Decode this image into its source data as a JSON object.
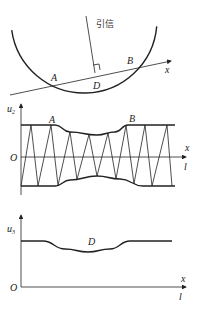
{
  "top_panel": {
    "fuze_label": "引信",
    "point_a": "A",
    "point_b": "B",
    "point_d": "D",
    "axis_x": "x",
    "circle": {
      "cx": 84,
      "cy": 20,
      "r": 73
    },
    "trajectory": {
      "x1": 10,
      "y1": 95,
      "x2": 171,
      "y2": 61
    },
    "fuze_line": {
      "x1": 86,
      "y1": 16,
      "x2": 95,
      "y2": 73
    }
  },
  "middle_panel": {
    "y_label": "u",
    "y_label_sub": "2",
    "origin": "O",
    "axis_x": "x",
    "axis_l": "l",
    "point_a": "A",
    "point_b": "B",
    "envelope_top": [
      [
        21,
        125
      ],
      [
        55,
        125
      ],
      [
        70,
        132
      ],
      [
        97,
        135
      ],
      [
        115,
        132
      ],
      [
        128,
        125
      ],
      [
        175,
        125
      ]
    ],
    "envelope_bottom": [
      [
        21,
        186
      ],
      [
        55,
        186
      ],
      [
        70,
        180
      ],
      [
        97,
        176
      ],
      [
        120,
        179
      ],
      [
        143,
        186
      ],
      [
        175,
        186
      ]
    ],
    "zigzag_x": [
      21,
      31,
      38,
      51,
      58,
      70,
      77,
      89,
      97,
      108,
      116,
      126,
      134,
      145,
      152,
      167,
      172
    ]
  },
  "bottom_panel": {
    "y_label": "u",
    "y_label_sub": "3",
    "origin": "O",
    "axis_x": "x",
    "axis_l": "l",
    "point_d": "D",
    "curve": [
      [
        21,
        241
      ],
      [
        43,
        241
      ],
      [
        65,
        249
      ],
      [
        88,
        252
      ],
      [
        110,
        249
      ],
      [
        130,
        241
      ],
      [
        172,
        241
      ]
    ]
  },
  "colors": {
    "line": "#222222",
    "background": "#ffffff"
  }
}
